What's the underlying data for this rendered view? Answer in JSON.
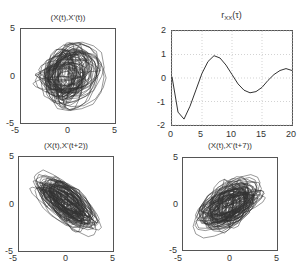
{
  "figure": {
    "panels": [
      {
        "id": "tl",
        "title": "(X(t),X'(t))"
      },
      {
        "id": "tr",
        "title_main": "r",
        "title_sub": "XX",
        "title_arg": "(τ)"
      },
      {
        "id": "bl",
        "title": "(X(t),X'(t+2))"
      },
      {
        "id": "br",
        "title": "(X(t),X'(t+7))"
      }
    ]
  },
  "chart_data": [
    {
      "type": "line",
      "title": "(X(t),X'(t))",
      "description": "Phase portrait: dense nested loops centered near origin",
      "xlim": [
        -5,
        5
      ],
      "ylim": [
        -5,
        5
      ],
      "xticks": [
        -5,
        0,
        5
      ],
      "yticks": [
        -5,
        0,
        5
      ],
      "xlabel": "",
      "ylabel": "",
      "grid": false
    },
    {
      "type": "line",
      "title": "r_XX(τ)",
      "xlim": [
        0,
        20
      ],
      "ylim": [
        -2,
        2
      ],
      "xticks": [
        0,
        5,
        10,
        15,
        20
      ],
      "yticks": [
        -2,
        -1,
        0,
        1,
        2
      ],
      "xlabel": "",
      "ylabel": "",
      "grid": true,
      "x": [
        0,
        1,
        2,
        3,
        4,
        5,
        6,
        7,
        8,
        9,
        10,
        11,
        12,
        13,
        14,
        15,
        16,
        17,
        18,
        19,
        20
      ],
      "values": [
        0.05,
        -1.45,
        -1.75,
        -1.2,
        -0.5,
        0.2,
        0.7,
        0.95,
        0.85,
        0.55,
        0.15,
        -0.25,
        -0.52,
        -0.63,
        -0.58,
        -0.4,
        -0.1,
        0.15,
        0.32,
        0.4,
        0.32
      ]
    },
    {
      "type": "line",
      "title": "(X(t),X'(t+2))",
      "description": "Delay portrait with negative correlation; cloud elongated from upper-left to lower-right",
      "xlim": [
        -5,
        5
      ],
      "ylim": [
        -5,
        5
      ],
      "xticks": [
        -5,
        0,
        5
      ],
      "yticks": [
        -5,
        0,
        5
      ],
      "xlabel": "",
      "ylabel": "",
      "grid": false
    },
    {
      "type": "line",
      "title": "(X(t),X'(t+7))",
      "description": "Delay portrait with positive correlation; cloud elongated from lower-left to upper-right",
      "xlim": [
        -5,
        5
      ],
      "ylim": [
        -5,
        5
      ],
      "xticks": [
        -5,
        0,
        5
      ],
      "yticks": [
        -5,
        0,
        5
      ],
      "xlabel": "",
      "ylabel": "",
      "grid": false
    }
  ],
  "ticks": {
    "phase_x": [
      "-5",
      "0",
      "5"
    ],
    "phase_y": [
      "5",
      "0",
      "-5"
    ],
    "corr_x": [
      "0",
      "5",
      "10",
      "15",
      "20"
    ],
    "corr_y": [
      "2",
      "1",
      "0",
      "-1",
      "-2"
    ]
  },
  "colors": {
    "line": "#333333",
    "frame": "#555555",
    "grid": "#c8c8c8"
  }
}
